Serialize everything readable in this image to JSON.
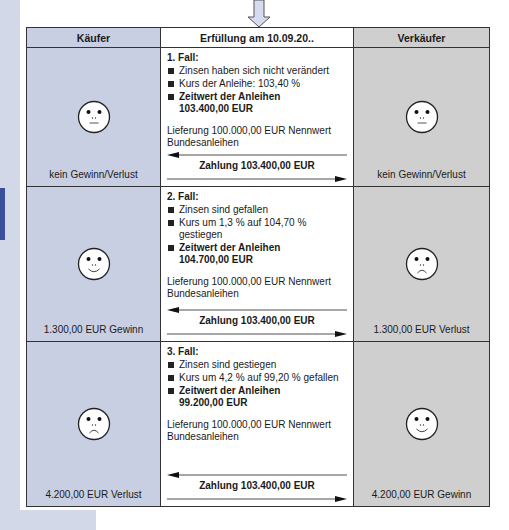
{
  "header": {
    "buyer": "Käufer",
    "settlement": "Erfüllung am 10.09.20..",
    "seller": "Verkäufer"
  },
  "colors": {
    "buyer_bg": "#c9cfe3",
    "seller_bg": "#cfcfcf",
    "strip": "#d3d8e8",
    "strip_tab": "#3a4f9c"
  },
  "cases": [
    {
      "title": "1. Fall:",
      "bullets": [
        "Zinsen haben sich nicht verändert",
        "Kurs der Anleihe: 103,40 %"
      ],
      "fair_value_label": "Zeitwert der Anleihen",
      "fair_value": "103.400,00 EUR",
      "delivery": "Lieferung 100.000,00 EUR Nennwert Bundesanleihen",
      "payment": "Zahlung 103.400,00 EUR",
      "buyer_face": "neutral-face-icon",
      "buyer_result": "kein Gewinn/Verlust",
      "seller_face": "neutral-face-icon",
      "seller_result": "kein Gewinn/Verlust"
    },
    {
      "title": "2. Fall:",
      "bullets": [
        "Zinsen sind gefallen",
        "Kurs um 1,3 % auf 104,70 % gestiegen"
      ],
      "fair_value_label": "Zeitwert der Anleihen",
      "fair_value": "104.700,00 EUR",
      "delivery": "Lieferung 100.000,00 EUR Nennwert Bundesanleihen",
      "payment": "Zahlung 103.400,00 EUR",
      "buyer_face": "happy-face-icon",
      "buyer_result": "1.300,00 EUR Gewinn",
      "seller_face": "sad-face-icon",
      "seller_result": "1.300,00 EUR Verlust"
    },
    {
      "title": "3. Fall:",
      "bullets": [
        "Zinsen sind gestiegen",
        "Kurs um 4,2 % auf 99,20 % gefallen"
      ],
      "fair_value_label": "Zeitwert der Anleihen",
      "fair_value": "99.200,00 EUR",
      "delivery": "Lieferung 100.000,00 EUR Nennwert Bundesanleihen",
      "payment": "Zahlung 103.400,00 EUR",
      "buyer_face": "sad-face-icon",
      "buyer_result": "4.200,00 EUR Verlust",
      "seller_face": "happy-face-icon",
      "seller_result": "4.200,00 EUR Gewinn"
    }
  ]
}
